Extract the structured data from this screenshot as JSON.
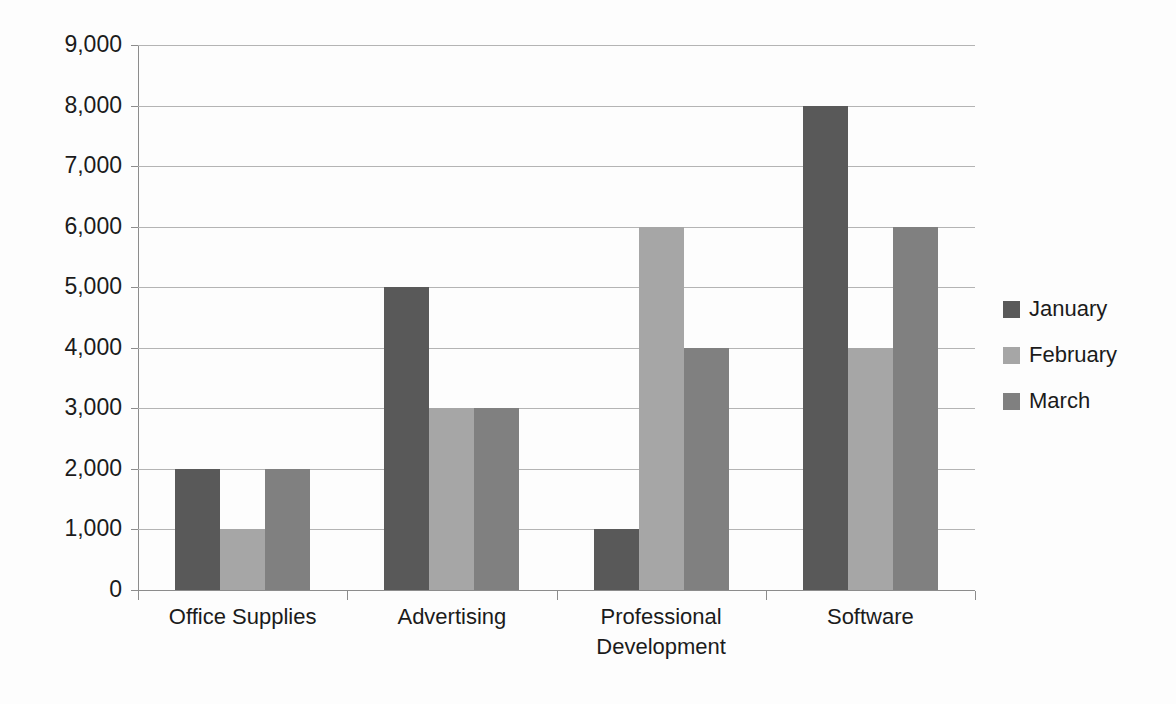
{
  "chart_data": {
    "type": "bar",
    "title": "",
    "subtitle": "",
    "xlabel": "",
    "ylabel": "",
    "grid": true,
    "legend_position": "right",
    "ylim": [
      0,
      9000
    ],
    "ytick_step": 1000,
    "ytick_labels": [
      "9,000",
      "8,000",
      "7,000",
      "6,000",
      "5,000",
      "4,000",
      "3,000",
      "2,000",
      "1,000",
      "0"
    ],
    "ytick_values": [
      9000,
      8000,
      7000,
      6000,
      5000,
      4000,
      3000,
      2000,
      1000,
      0
    ],
    "categories": [
      "Office Supplies",
      "Advertising",
      "Professional Development",
      "Software"
    ],
    "category_label_lines": [
      [
        "Office Supplies"
      ],
      [
        "Advertising"
      ],
      [
        "Professional",
        "Development"
      ],
      [
        "Software"
      ]
    ],
    "series": [
      {
        "name": "January",
        "color": "#595959",
        "values": [
          2000,
          5000,
          1000,
          8000
        ]
      },
      {
        "name": "February",
        "color": "#a6a6a6",
        "values": [
          1000,
          3000,
          6000,
          4000
        ]
      },
      {
        "name": "March",
        "color": "#808080",
        "values": [
          2000,
          3000,
          4000,
          6000
        ]
      }
    ]
  },
  "legend": {
    "items": [
      {
        "label": "January",
        "color": "#595959"
      },
      {
        "label": "February",
        "color": "#a6a6a6"
      },
      {
        "label": "March",
        "color": "#808080"
      }
    ]
  },
  "colors": {
    "background": "#fdfdfd",
    "gridline": "#b4b4b4",
    "axis": "#8c8c8c",
    "text": "#1b1b1b",
    "january": "#595959",
    "february": "#a6a6a6",
    "march": "#808080"
  }
}
